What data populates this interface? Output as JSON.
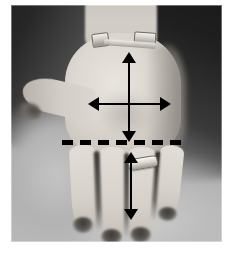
{
  "figure": {
    "kind": "photograph-with-measurement-annotations",
    "color_mode": "grayscale",
    "background_color": "#ffffff",
    "plate_border_color": "#ffffff"
  },
  "photo": {
    "alt_text": "Grayscale photograph of an open palm with measurement arrows and a dashed reference line",
    "background_tone": "#a2a2a2",
    "skin_tone": "#ddd8d1",
    "shadow_tone": "#1d1d1d"
  },
  "hand": {
    "palm_label": "palm",
    "thumb_label": "thumb",
    "fingers": [
      {
        "name": "index-finger"
      },
      {
        "name": "middle-finger"
      },
      {
        "name": "ring-finger"
      },
      {
        "name": "little-finger"
      }
    ],
    "jewellery": [
      {
        "name": "wrist-bracelet-left",
        "type": "bracelet"
      },
      {
        "name": "wrist-bracelet-right",
        "type": "bracelet"
      },
      {
        "name": "wrist-band",
        "type": "watch-band"
      },
      {
        "name": "finger-ring",
        "type": "ring",
        "worn_on": "ring-finger"
      }
    ]
  },
  "annotations": {
    "arrow_color": "#000000",
    "dash_color": "#000000",
    "items": [
      {
        "name": "palm-length-arrow",
        "icon": "double-headed-vertical-arrow",
        "orientation": "vertical",
        "heads": 2,
        "region": "palm",
        "meaning": "palm length measurement"
      },
      {
        "name": "palm-width-arrow",
        "icon": "double-headed-horizontal-arrow",
        "orientation": "horizontal",
        "heads": 2,
        "region": "palm",
        "meaning": "palm width measurement"
      },
      {
        "name": "distal-crease-dashed-line",
        "icon": "dashed-horizontal-line",
        "orientation": "horizontal",
        "region": "base of fingers",
        "meaning": "reference baseline at finger base"
      },
      {
        "name": "middle-finger-length-arrow",
        "icon": "double-headed-vertical-arrow",
        "orientation": "vertical",
        "heads": 2,
        "region": "middle-finger",
        "meaning": "finger length measurement"
      }
    ]
  }
}
